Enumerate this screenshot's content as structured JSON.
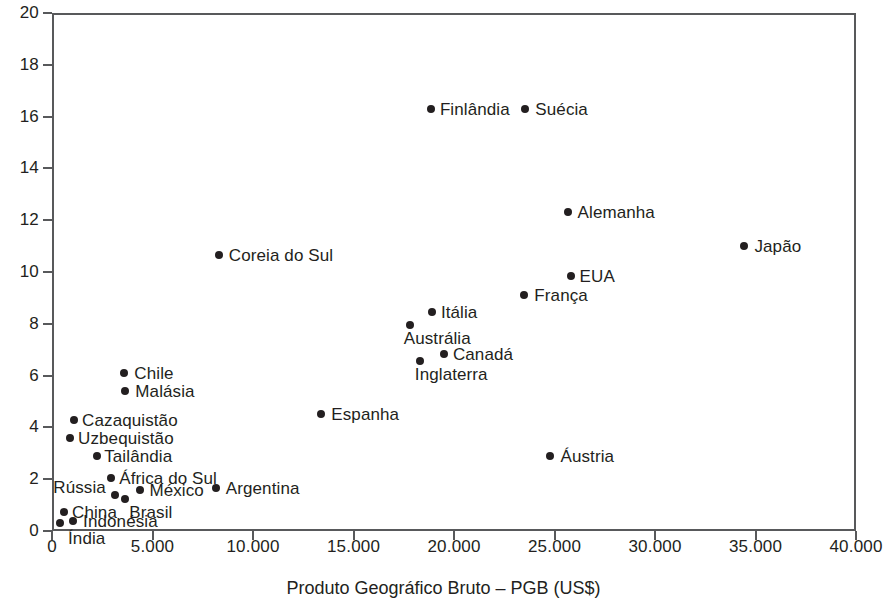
{
  "chart_data": {
    "type": "scatter",
    "title": "",
    "xlabel": "Produto Geográfico Bruto – PGB (US$)",
    "ylabel": "",
    "xlim": [
      0,
      40000
    ],
    "ylim": [
      0,
      20
    ],
    "grid": false,
    "legend": "none",
    "xticks": [
      "0",
      "5.000",
      "10.000",
      "15.000",
      "20.000",
      "25.000",
      "30.000",
      "35.000",
      "40.000"
    ],
    "xtick_values": [
      0,
      5000,
      10000,
      15000,
      20000,
      25000,
      30000,
      35000,
      40000
    ],
    "yticks": [
      "0",
      "2",
      "4",
      "6",
      "8",
      "10",
      "12",
      "14",
      "16",
      "18",
      "20"
    ],
    "ytick_values": [
      0,
      2,
      4,
      6,
      8,
      10,
      12,
      14,
      16,
      18,
      20
    ],
    "points": [
      {
        "label": "Índia",
        "x": 400,
        "y": 0.3,
        "lx": 8,
        "ly": 14
      },
      {
        "label": "Indonésia",
        "x": 1050,
        "y": 0.4,
        "lx": 10,
        "ly": -1
      },
      {
        "label": "China",
        "x": 600,
        "y": 0.75,
        "lx": 8,
        "ly": -1
      },
      {
        "label": "Brasil",
        "x": 3650,
        "y": 1.25,
        "lx": 4,
        "ly": 12
      },
      {
        "label": "Rússia",
        "x": 3150,
        "y": 1.4,
        "lx": -62,
        "ly": -9
      },
      {
        "label": "México",
        "x": 4400,
        "y": 1.6,
        "lx": 9,
        "ly": -1
      },
      {
        "label": "Argentina",
        "x": 8150,
        "y": 1.65,
        "lx": 10,
        "ly": -1
      },
      {
        "label": "África do Sul",
        "x": 2950,
        "y": 2.05,
        "lx": 8,
        "ly": -1
      },
      {
        "label": "Tailândia",
        "x": 2250,
        "y": 2.9,
        "lx": 7,
        "ly": -1
      },
      {
        "label": "Uzbequistão",
        "x": 900,
        "y": 3.6,
        "lx": 8,
        "ly": -1
      },
      {
        "label": "Cazaquistão",
        "x": 1100,
        "y": 4.3,
        "lx": 8,
        "ly": -1
      },
      {
        "label": "Espanha",
        "x": 13400,
        "y": 4.5,
        "lx": 10,
        "ly": -1
      },
      {
        "label": "Malásia",
        "x": 3650,
        "y": 5.4,
        "lx": 10,
        "ly": -1
      },
      {
        "label": "Chile",
        "x": 3600,
        "y": 6.1,
        "lx": 10,
        "ly": -1
      },
      {
        "label": "Inglaterra",
        "x": 18300,
        "y": 6.55,
        "lx": -5,
        "ly": 12
      },
      {
        "label": "Canadá",
        "x": 19500,
        "y": 6.85,
        "lx": 9,
        "ly": -1
      },
      {
        "label": "Austrália",
        "x": 17800,
        "y": 7.95,
        "lx": -6,
        "ly": 12
      },
      {
        "label": "Itália",
        "x": 18900,
        "y": 8.45,
        "lx": 9,
        "ly": -1
      },
      {
        "label": "Áustria",
        "x": 24800,
        "y": 2.9,
        "lx": 10,
        "ly": -1
      },
      {
        "label": "França",
        "x": 23500,
        "y": 9.1,
        "lx": 10,
        "ly": -1
      },
      {
        "label": "EUA",
        "x": 25800,
        "y": 9.85,
        "lx": 9,
        "ly": -1
      },
      {
        "label": "Japão",
        "x": 34450,
        "y": 11.0,
        "lx": 10,
        "ly": -1
      },
      {
        "label": "Alemanha",
        "x": 25650,
        "y": 12.3,
        "lx": 10,
        "ly": -1
      },
      {
        "label": "Coreia do Sul",
        "x": 8300,
        "y": 10.65,
        "lx": 10,
        "ly": -1
      },
      {
        "label": "Finlândia",
        "x": 18850,
        "y": 16.3,
        "lx": 9,
        "ly": -1
      },
      {
        "label": "Suécia",
        "x": 23550,
        "y": 16.3,
        "lx": 10,
        "ly": -1
      }
    ]
  },
  "axis": {
    "x_title": "Produto Geográfico Bruto – PGB (US$)"
  },
  "colors": {
    "marker": "#231f20",
    "frame": "#58595b",
    "text": "#231f20",
    "background": "#ffffff"
  }
}
